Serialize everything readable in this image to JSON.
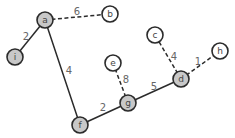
{
  "graph": {
    "colors": {
      "node_filled": "#c8c8c8",
      "node_empty": "#ffffff",
      "stroke": "#2b2b2b",
      "label": "#444444",
      "weight": "#666666"
    },
    "nodes": [
      {
        "id": "a",
        "label": "a",
        "x": 45,
        "y": 20,
        "filled": true
      },
      {
        "id": "b",
        "label": "b",
        "x": 110,
        "y": 14,
        "filled": false
      },
      {
        "id": "i",
        "label": "i",
        "x": 15,
        "y": 57,
        "filled": true
      },
      {
        "id": "c",
        "label": "c",
        "x": 155,
        "y": 35,
        "filled": false
      },
      {
        "id": "h",
        "label": "h",
        "x": 220,
        "y": 51,
        "filled": false
      },
      {
        "id": "d",
        "label": "d",
        "x": 181,
        "y": 79,
        "filled": true
      },
      {
        "id": "e",
        "label": "e",
        "x": 113,
        "y": 63,
        "filled": false
      },
      {
        "id": "g",
        "label": "g",
        "x": 128,
        "y": 103,
        "filled": true
      },
      {
        "id": "f",
        "label": "f",
        "x": 80,
        "y": 125,
        "filled": true
      }
    ],
    "edges": [
      {
        "from": "a",
        "to": "b",
        "weight": "6",
        "style": "dashed",
        "wx": 77,
        "wy": 11
      },
      {
        "from": "a",
        "to": "i",
        "weight": "2",
        "style": "solid",
        "wx": 26,
        "wy": 36
      },
      {
        "from": "a",
        "to": "f",
        "weight": "4",
        "style": "solid",
        "wx": 69,
        "wy": 70
      },
      {
        "from": "f",
        "to": "g",
        "weight": "2",
        "style": "solid",
        "wx": 103,
        "wy": 107
      },
      {
        "from": "g",
        "to": "d",
        "weight": "5",
        "style": "solid",
        "wx": 154,
        "wy": 86
      },
      {
        "from": "g",
        "to": "e",
        "weight": "8",
        "style": "dashed",
        "wx": 126,
        "wy": 79
      },
      {
        "from": "d",
        "to": "c",
        "weight": "4",
        "style": "dashed",
        "wx": 174,
        "wy": 56
      },
      {
        "from": "d",
        "to": "h",
        "weight": "1",
        "style": "dashed",
        "wx": 198,
        "wy": 61
      }
    ]
  }
}
